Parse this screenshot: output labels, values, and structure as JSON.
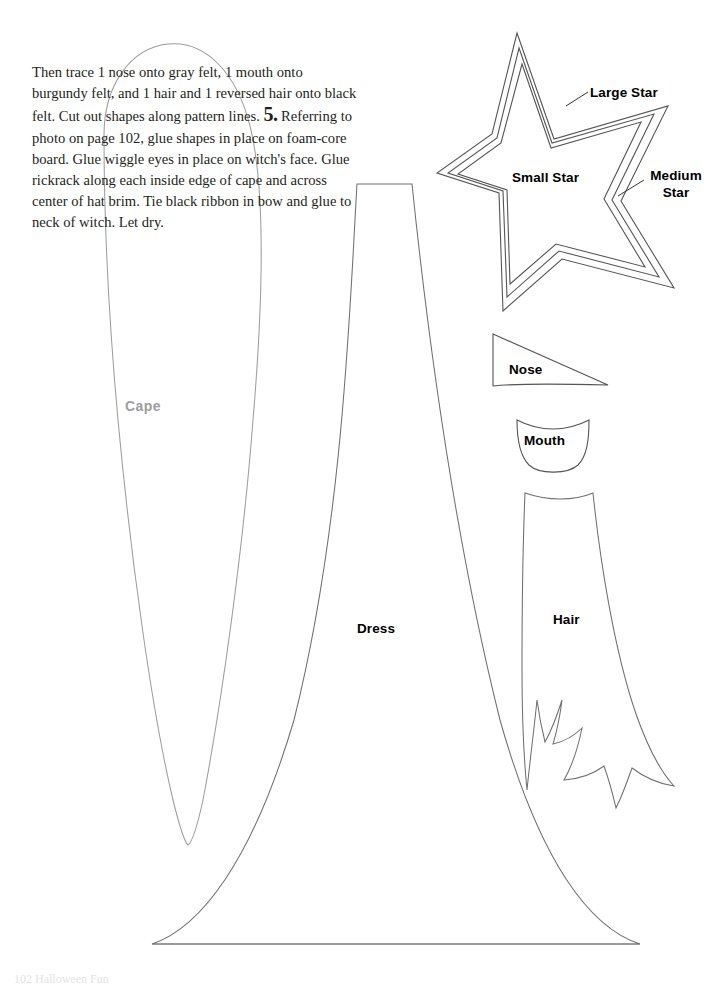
{
  "page": {
    "width": 713,
    "height": 985,
    "background": "#ffffff",
    "ink_color": "#666666",
    "label_color": "#000000",
    "cape_label_color": "#9d9d9d",
    "body_text_color": "#231f20"
  },
  "instructions": {
    "continuation_text": "Then trace 1 nose onto gray felt, 1 mouth onto burgundy felt, and 1 hair and 1 reversed hair onto black felt. Cut out shapes along pattern lines.",
    "step_number": "5.",
    "step_text": "Referring to photo on page 102, glue shapes in place on foam-core board. Glue wiggle eyes in place on witch's face. Glue rickrack along each inside edge of cape and across center of hat brim. Tie black ribbon in bow and glue to neck of witch. Let dry."
  },
  "labels": {
    "cape": "Cape",
    "dress": "Dress",
    "hair": "Hair",
    "nose": "Nose",
    "mouth": "Mouth",
    "large_star": "Large Star",
    "small_star": "Small Star",
    "medium_star_line1": "Medium",
    "medium_star_line2": "Star"
  },
  "footer": {
    "text": "102 Halloween Fun"
  },
  "shapes": [
    {
      "name": "cape",
      "label": "Cape",
      "description": "tall narrow teardrop cape pattern piece, rounded top, pointed bottom"
    },
    {
      "name": "dress",
      "label": "Dress",
      "description": "wide triangular a-line dress pattern piece with flat top and flat bottom hem"
    },
    {
      "name": "hair",
      "label": "Hair",
      "description": "long hair pattern piece with jagged pointed bottom tips"
    },
    {
      "name": "nose",
      "label": "Nose",
      "description": "triangular nose pattern piece with slightly curved bottom edge"
    },
    {
      "name": "mouth",
      "label": "Mouth",
      "description": "rounded u-shaped mouth pattern piece with concave top edge"
    },
    {
      "name": "large-star",
      "label": "Large Star",
      "description": "outermost five-pointed star outline"
    },
    {
      "name": "medium-star",
      "label": "Medium Star",
      "description": "middle five-pointed star outline"
    },
    {
      "name": "small-star",
      "label": "Small Star",
      "description": "innermost five-pointed star outline"
    }
  ]
}
